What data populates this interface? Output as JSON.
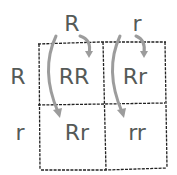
{
  "diagram": {
    "type": "punnett-square",
    "column_alleles": [
      "R",
      "r"
    ],
    "row_alleles": [
      "R",
      "r"
    ],
    "cells": [
      [
        "RR",
        "Rr"
      ],
      [
        "Rr",
        "rr"
      ]
    ],
    "colors": {
      "text": "#555a57",
      "grid": "#222222",
      "arrows": "#9a9a9a"
    }
  }
}
